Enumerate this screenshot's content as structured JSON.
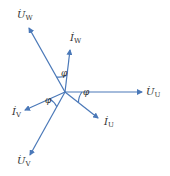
{
  "diagram": {
    "type": "phasor-diagram",
    "origin": {
      "x": 65,
      "y": 92
    },
    "line_color": "#4a78b8",
    "text_color": "#333333",
    "phasors": [
      {
        "id": "U_W",
        "symbol": "U",
        "subscript": "W",
        "x2": 29,
        "y2": 28,
        "label_x": 17,
        "label_y": 10
      },
      {
        "id": "I_W",
        "symbol": "I",
        "subscript": "W",
        "x2": 70,
        "y2": 50,
        "label_x": 70,
        "label_y": 33
      },
      {
        "id": "U_U",
        "symbol": "U",
        "subscript": "U",
        "x2": 142,
        "y2": 92,
        "label_x": 146,
        "label_y": 87
      },
      {
        "id": "I_U",
        "symbol": "I",
        "subscript": "U",
        "x2": 98,
        "y2": 118,
        "label_x": 104,
        "label_y": 117
      },
      {
        "id": "I_V",
        "symbol": "I",
        "subscript": "V",
        "x2": 25,
        "y2": 110,
        "label_x": 12,
        "label_y": 107
      },
      {
        "id": "U_V",
        "symbol": "U",
        "subscript": "V",
        "x2": 30,
        "y2": 155,
        "label_x": 17,
        "label_y": 156
      }
    ],
    "angle_label": "φ",
    "angle_labels": [
      {
        "between": "U_W-I_W",
        "x": 61,
        "y": 69
      },
      {
        "between": "U_U-I_U",
        "x": 83,
        "y": 88
      },
      {
        "between": "I_V-U_V",
        "x": 45,
        "y": 96
      }
    ],
    "dot_glyph": "·"
  }
}
